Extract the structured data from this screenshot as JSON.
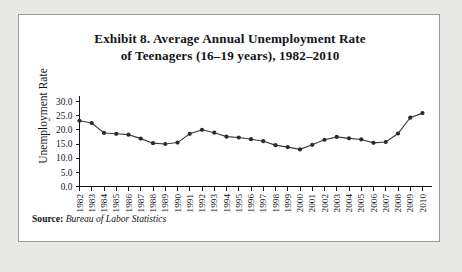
{
  "figure": {
    "title_line1": "Exhibit 8. Average Annual Unemployment Rate",
    "title_line2": "of Teenagers (16–19 years), 1982–2010",
    "source_label": "Source:",
    "source_value": "Bureau of Labor Statistics"
  },
  "chart_data": {
    "type": "line",
    "title": "Exhibit 8. Average Annual Unemployment Rate of Teenagers (16–19 years), 1982–2010",
    "xlabel": "",
    "ylabel": "Unemployment Rate",
    "ylim": [
      0.0,
      30.0
    ],
    "ytick_step": 5.0,
    "ytick_labels": [
      "0.0",
      "5.0",
      "10.0",
      "15.0",
      "20.0",
      "25.0",
      "30.0"
    ],
    "ytick_values": [
      0.0,
      5.0,
      10.0,
      15.0,
      20.0,
      25.0,
      30.0
    ],
    "grid": false,
    "legend": "none",
    "marker": "filled-circle",
    "categories": [
      "1982",
      "1983",
      "1984",
      "1985",
      "1986",
      "1987",
      "1988",
      "1989",
      "1990",
      "1991",
      "1992",
      "1993",
      "1994",
      "1995",
      "1996",
      "1997",
      "1998",
      "1999",
      "2000",
      "2001",
      "2002",
      "2003",
      "2004",
      "2005",
      "2006",
      "2007",
      "2008",
      "2009",
      "2010"
    ],
    "values": [
      23.2,
      22.4,
      18.9,
      18.6,
      18.3,
      16.9,
      15.3,
      15.0,
      15.5,
      18.6,
      20.0,
      19.0,
      17.6,
      17.3,
      16.7,
      16.0,
      14.6,
      13.9,
      13.1,
      14.7,
      16.5,
      17.5,
      17.0,
      16.6,
      15.4,
      15.7,
      18.7,
      24.3,
      25.9
    ]
  }
}
